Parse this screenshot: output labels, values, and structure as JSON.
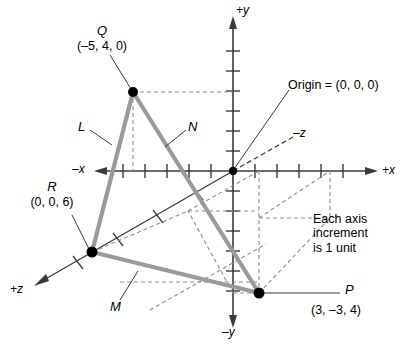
{
  "figure": {
    "geometry": {
      "origin_px": [
        233,
        171
      ],
      "x_unit_px": 22,
      "y_unit_px": 20,
      "points": {
        "Q": [
          133,
          92
        ],
        "R": [
          92,
          252
        ],
        "P": [
          259,
          293
        ]
      }
    },
    "colors": {
      "triangle": "#9a9a9a",
      "axis": "#3a3a3a",
      "dashed": "#8c8c8c",
      "text": "#000000",
      "point": "#000000"
    }
  },
  "axes": {
    "y_positive": "+y",
    "y_negative": "–y",
    "x_positive": "+x",
    "x_negative": "–x",
    "z_positive": "+z",
    "z_negative": "–z"
  },
  "origin": {
    "label": "Origin = (0, 0, 0)"
  },
  "points": [
    {
      "id": "Q",
      "name": "Q",
      "coords": "(–5, 4, 0)"
    },
    {
      "id": "R",
      "name": "R",
      "coords": "(0, 0, 6)"
    },
    {
      "id": "P",
      "name": "P",
      "coords": "(3, –3, 4)"
    }
  ],
  "segments": [
    {
      "id": "L",
      "label": "L"
    },
    {
      "id": "N",
      "label": "N"
    },
    {
      "id": "M",
      "label": "M"
    }
  ],
  "note": {
    "line1": "Each axis",
    "line2": "increment",
    "line3": "is 1 unit"
  }
}
